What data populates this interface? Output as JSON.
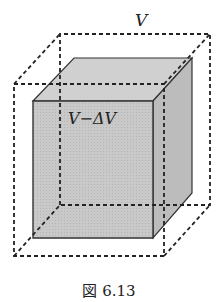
{
  "figure": {
    "caption": "図 6.13",
    "labels": {
      "outer_volume": "V",
      "inner_volume": "V−ΔV"
    },
    "colors": {
      "cube_front": "#c8c8c8",
      "cube_top": "#cfcfcf",
      "cube_side": "#bdbdbd",
      "stroke": "#333333",
      "dash": "#222222"
    }
  }
}
